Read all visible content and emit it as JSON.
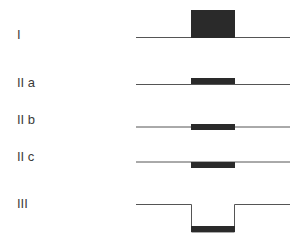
{
  "diagram": {
    "rows": [
      {
        "label": "I",
        "label_y": 28
      },
      {
        "label": "II a",
        "label_y": 76
      },
      {
        "label": "II b",
        "label_y": 113
      },
      {
        "label": "II c",
        "label_y": 150
      },
      {
        "label": "III",
        "label_y": 197
      }
    ],
    "colors": {
      "line": "#555555",
      "bar": "#2a2a2a"
    }
  }
}
